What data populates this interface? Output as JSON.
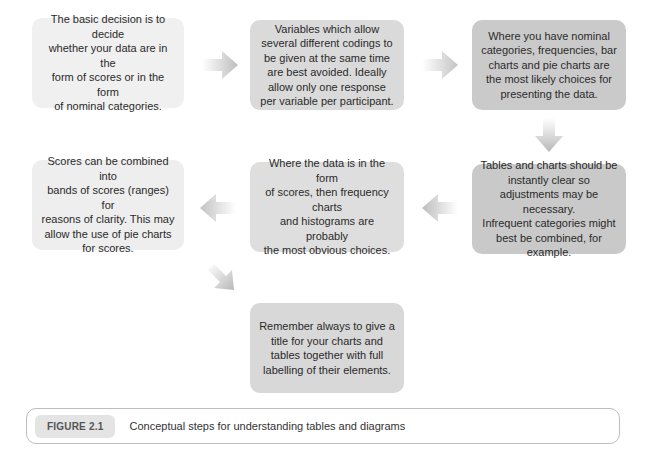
{
  "diagram": {
    "type": "flowchart",
    "boxes": [
      {
        "id": 1,
        "text": "The basic decision is to decide\nwhether your data are in the\nform of scores or in the form\nof  nominal categories."
      },
      {
        "id": 2,
        "text": "Variables which allow\nseveral different codings to\nbe given at the same time\nare best avoided. Ideally\nallow only one response\nper variable per participant."
      },
      {
        "id": 3,
        "text": "Where you have nominal\ncategories, frequencies, bar\ncharts and pie charts are\nthe most likely choices for\npresenting the data."
      },
      {
        "id": 4,
        "text": "Tables and charts should be\ninstantly clear so\nadjustments may be necessary.\nInfrequent categories might\nbest be combined, for example."
      },
      {
        "id": 5,
        "text": "Where the data is in the form\nof scores, then frequency charts\nand histograms are probably\nthe most obvious choices."
      },
      {
        "id": 6,
        "text": "Scores can be combined into\nbands of scores (ranges) for\nreasons of clarity. This may\nallow the use of pie charts\nfor scores."
      },
      {
        "id": 7,
        "text": "Remember always to give a\ntitle for your charts and\ntables together with full\nlabelling of their elements."
      }
    ],
    "arrows": [
      {
        "from": 1,
        "to": 2,
        "direction": "right"
      },
      {
        "from": 2,
        "to": 3,
        "direction": "right"
      },
      {
        "from": 3,
        "to": 4,
        "direction": "down"
      },
      {
        "from": 4,
        "to": 5,
        "direction": "left"
      },
      {
        "from": 5,
        "to": 6,
        "direction": "left"
      },
      {
        "from": 6,
        "to": 7,
        "direction": "down-right"
      }
    ]
  },
  "caption": {
    "label": "FIGURE 2.1",
    "title": "Conceptual steps for understanding tables and diagrams"
  }
}
